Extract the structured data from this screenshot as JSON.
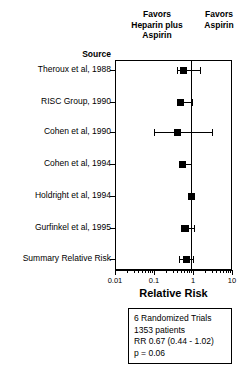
{
  "headers": {
    "left": "Favors\nHeparin plus\nAspirin",
    "left_line1": "Favors",
    "left_line2": "Heparin plus",
    "left_line3": "Aspirin",
    "right_line1": "Favors",
    "right_line2": "Aspirin",
    "source": "Source"
  },
  "axis": {
    "title": "Relative Risk",
    "ticks": [
      "0.01",
      "0.1",
      "1",
      "10"
    ],
    "tick_values": [
      0.01,
      0.1,
      1,
      10
    ],
    "scale": "log",
    "xlim": [
      0.01,
      10
    ],
    "reference_line": 1
  },
  "summary_box": {
    "line1": "6 Randomized Trials",
    "line2": "1353 patients",
    "line3": "RR 0.67 (0.44 - 1.02)",
    "line4": "p = 0.06"
  },
  "chart_data": {
    "type": "scatter",
    "subtype": "forest-plot",
    "title": "",
    "xlabel": "Relative Risk",
    "ylabel": "Source",
    "xlim": [
      0.01,
      10
    ],
    "xscale": "log",
    "grid": false,
    "legend": "none",
    "reference_line": 1,
    "annotations": [
      "Favors Heparin plus Aspirin",
      "Favors Aspirin",
      "6 Randomized Trials",
      "1353 patients",
      "RR 0.67 (0.44 - 1.02)",
      "p = 0.06"
    ],
    "categories": [
      "Theroux et al, 1988",
      "RISC Group, 1990",
      "Cohen et al, 1990",
      "Cohen et al, 1994",
      "Holdright et al, 1994",
      "Gurfinkel et al, 1995",
      "Summary Relative Risk"
    ],
    "series": [
      {
        "name": "Relative Risk",
        "values": [
          0.58,
          0.49,
          0.4,
          0.55,
          0.92,
          0.63,
          0.67
        ]
      },
      {
        "name": "CI lower",
        "values": [
          0.38,
          0.38,
          0.1,
          0.43,
          0.8,
          0.48,
          0.44
        ]
      },
      {
        "name": "CI upper",
        "values": [
          1.55,
          0.92,
          3.0,
          0.89,
          1.07,
          1.05,
          1.02
        ]
      }
    ],
    "points": [
      {
        "label": "Theroux et al, 1988",
        "rr": 0.58,
        "ci_low": 0.38,
        "ci_high": 1.55
      },
      {
        "label": "RISC Group, 1990",
        "rr": 0.49,
        "ci_low": 0.38,
        "ci_high": 0.92
      },
      {
        "label": "Cohen et al, 1990",
        "rr": 0.4,
        "ci_low": 0.1,
        "ci_high": 3.0
      },
      {
        "label": "Cohen et al, 1994",
        "rr": 0.55,
        "ci_low": 0.43,
        "ci_high": 0.89
      },
      {
        "label": "Holdright et al, 1994",
        "rr": 0.92,
        "ci_low": 0.8,
        "ci_high": 1.07
      },
      {
        "label": "Gurfinkel et al, 1995",
        "rr": 0.63,
        "ci_low": 0.48,
        "ci_high": 1.05
      },
      {
        "label": "Summary Relative Risk",
        "rr": 0.67,
        "ci_low": 0.44,
        "ci_high": 1.02
      }
    ]
  },
  "geometry": {
    "rows_y": [
      70,
      102,
      132,
      164,
      196,
      228,
      259
    ],
    "plot_left": 115,
    "plot_right": 232,
    "plot_top": 60,
    "plot_bottom": 270
  }
}
